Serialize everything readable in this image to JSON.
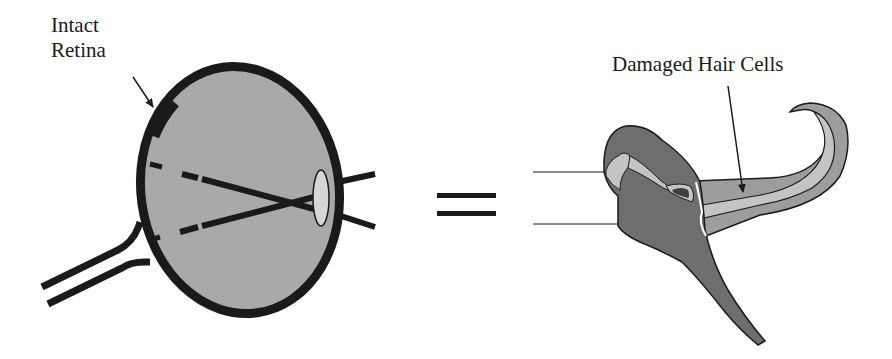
{
  "diagram": {
    "left_figure": {
      "name": "eye",
      "label_line1": "Intact",
      "label_line2": "Retina"
    },
    "operator": "=",
    "right_figure": {
      "name": "cochlea",
      "label": "Damaged Hair Cells"
    }
  },
  "colors": {
    "eye_fill": "#a9a9a9",
    "eye_outline": "#1a1a1a",
    "lens_fill": "#d6d6d6",
    "cochlea_dark": "#6e6e6e",
    "cochlea_mid": "#9d9d9d",
    "cochlea_light": "#c4c4c4",
    "cochlea_darkest": "#3e3e3e",
    "stroke": "#1a1a1a"
  }
}
